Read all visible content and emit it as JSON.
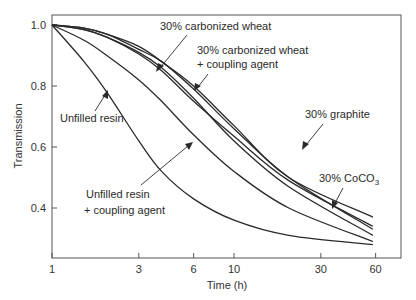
{
  "chart_data": {
    "type": "line",
    "title": "",
    "xlabel": "Time (h)",
    "ylabel": "Transmission",
    "xscale": "log",
    "xlim": [
      1,
      75
    ],
    "ylim": [
      0.24,
      1.03
    ],
    "x_ticks": [
      1,
      3,
      6,
      10,
      30,
      60
    ],
    "x_tick_labels": [
      "1",
      "3",
      "6",
      "10",
      "30",
      "60"
    ],
    "y_ticks": [
      0.4,
      0.6,
      0.8,
      1.0
    ],
    "y_tick_labels": [
      "0.4",
      "0.6",
      "0.8",
      "1.0"
    ],
    "grid": false,
    "legend": "inline annotations",
    "x": [
      1,
      1.5,
      2,
      3,
      4,
      6,
      10,
      20,
      58
    ],
    "series": [
      {
        "name": "Unfilled resin",
        "values": [
          1.0,
          0.88,
          0.78,
          0.62,
          0.52,
          0.43,
          0.36,
          0.31,
          0.28
        ]
      },
      {
        "name": "Unfilled resin + coupling agent",
        "values": [
          1.0,
          0.95,
          0.9,
          0.82,
          0.75,
          0.64,
          0.52,
          0.4,
          0.29
        ]
      },
      {
        "name": "30% carbonized wheat",
        "values": [
          1.0,
          0.985,
          0.96,
          0.91,
          0.86,
          0.76,
          0.62,
          0.47,
          0.31
        ]
      },
      {
        "name": "30% carbonized wheat + coupling agent",
        "values": [
          1.0,
          0.99,
          0.97,
          0.92,
          0.88,
          0.79,
          0.66,
          0.5,
          0.33
        ]
      },
      {
        "name": "30% graphite",
        "values": [
          1.0,
          0.985,
          0.96,
          0.905,
          0.85,
          0.75,
          0.635,
          0.49,
          0.34
        ]
      },
      {
        "name": "30% CoCO3",
        "values": [
          1.0,
          0.99,
          0.97,
          0.93,
          0.88,
          0.8,
          0.67,
          0.5,
          0.37
        ]
      }
    ],
    "annotations": [
      {
        "text": "30% carbonized wheat",
        "x_px": 160,
        "y_px": 30
      },
      {
        "text": "30% carbonized wheat",
        "x_px": 197,
        "y_px": 54
      },
      {
        "text": "+ coupling agent",
        "x_px": 197,
        "y_px": 68
      },
      {
        "text": "Unfilled resin",
        "x_px": 60,
        "y_px": 122
      },
      {
        "text": "30% graphite",
        "x_px": 305,
        "y_px": 118
      },
      {
        "text": "30% CoCO",
        "x_px": 319,
        "y_px": 182,
        "subscript": "3"
      },
      {
        "text": "Unfilled resin",
        "x_px": 86,
        "y_px": 198
      },
      {
        "text": "+ coupling agent",
        "x_px": 84,
        "y_px": 214
      }
    ]
  }
}
